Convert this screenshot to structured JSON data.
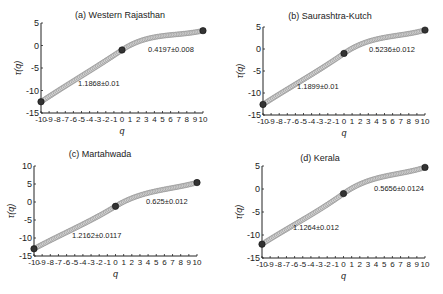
{
  "chart_data": [
    {
      "type": "line",
      "title": "(a) Western Rajasthan",
      "xlabel": "q",
      "ylabel": "τ(q)",
      "xlim": [
        -10,
        10
      ],
      "ylim": [
        -15,
        5
      ],
      "xticks": [
        -10,
        -9,
        -8,
        -7,
        -6,
        -5,
        -4,
        -3,
        -2,
        -1,
        0,
        1,
        2,
        3,
        4,
        5,
        6,
        7,
        8,
        9,
        10
      ],
      "yticks": [
        5,
        0,
        -5,
        -10,
        -15
      ],
      "grid": false,
      "key_points": [
        {
          "q": -10,
          "tau": -12.5
        },
        {
          "q": 0,
          "tau": -1.0
        },
        {
          "q": 10,
          "tau": 3.3
        }
      ],
      "annotations": [
        {
          "text": "1.1868±0.01",
          "segment": "q<0",
          "slope": 1.1868,
          "err": 0.01
        },
        {
          "text": "0.4197±0.008",
          "segment": "q>0",
          "slope": 0.4197,
          "err": 0.008
        }
      ]
    },
    {
      "type": "line",
      "title": "(b) Saurashtra-Kutch",
      "xlabel": "q",
      "ylabel": "τ(q)",
      "xlim": [
        -10,
        10
      ],
      "ylim": [
        -15,
        5
      ],
      "xticks": [
        -10,
        -9,
        -8,
        -7,
        -6,
        -5,
        -4,
        -3,
        -2,
        -1,
        0,
        1,
        2,
        3,
        4,
        5,
        6,
        7,
        8,
        9,
        10
      ],
      "yticks": [
        5,
        0,
        -5,
        -10,
        -15
      ],
      "grid": false,
      "key_points": [
        {
          "q": -10,
          "tau": -12.6
        },
        {
          "q": 0,
          "tau": -1.0
        },
        {
          "q": 10,
          "tau": 4.3
        }
      ],
      "annotations": [
        {
          "text": "1.1899±0.01",
          "segment": "q<0",
          "slope": 1.1899,
          "err": 0.01
        },
        {
          "text": "0.5236±0.012",
          "segment": "q>0",
          "slope": 0.5236,
          "err": 0.012
        }
      ]
    },
    {
      "type": "line",
      "title": "(c) Martahwada",
      "xlabel": "q",
      "ylabel": "τ(q)",
      "xlim": [
        -10,
        10
      ],
      "ylim": [
        -15,
        10
      ],
      "xticks": [
        -10,
        -9,
        -8,
        -7,
        -6,
        -5,
        -4,
        -3,
        -2,
        -1,
        0,
        1,
        2,
        3,
        4,
        5,
        6,
        7,
        8,
        9,
        10
      ],
      "yticks": [
        10,
        5,
        0,
        -5,
        -10,
        -15
      ],
      "grid": false,
      "key_points": [
        {
          "q": -10,
          "tau": -13.0
        },
        {
          "q": 0,
          "tau": -1.2
        },
        {
          "q": 10,
          "tau": 5.4
        }
      ],
      "annotations": [
        {
          "text": "1.2162±0.0117",
          "segment": "q<0",
          "slope": 1.2162,
          "err": 0.0117
        },
        {
          "text": "0.625±0.012",
          "segment": "q>0",
          "slope": 0.625,
          "err": 0.012
        }
      ]
    },
    {
      "type": "line",
      "title": "(d) Kerala",
      "xlabel": "q",
      "ylabel": "τ(q)",
      "xlim": [
        -10,
        10
      ],
      "ylim": [
        -15,
        5
      ],
      "xticks": [
        -10,
        -9,
        -8,
        -7,
        -6,
        -5,
        -4,
        -3,
        -2,
        -1,
        0,
        1,
        2,
        3,
        4,
        5,
        6,
        7,
        8,
        9,
        10
      ],
      "yticks": [
        5,
        0,
        -5,
        -10,
        -15
      ],
      "grid": false,
      "key_points": [
        {
          "q": -10,
          "tau": -12.0
        },
        {
          "q": 0,
          "tau": -1.0
        },
        {
          "q": 10,
          "tau": 4.7
        }
      ],
      "annotations": [
        {
          "text": "1.1264±0.012",
          "segment": "q<0",
          "slope": 1.1264,
          "err": 0.012
        },
        {
          "text": "0.5656±0.0124",
          "segment": "q>0",
          "slope": 0.5656,
          "err": 0.0124
        }
      ]
    }
  ],
  "layout": [
    {
      "left": 0,
      "top": 0,
      "ax_x0": 41,
      "ax_x1": 203,
      "ax_ytop": 23,
      "ax_ybot": 113,
      "title_x": 120,
      "title_y": 18,
      "left_ann": {
        "x": 78,
        "y": 86
      },
      "right_ann": {
        "x": 148,
        "y": 52
      }
    },
    {
      "left": 0,
      "top": 0,
      "ax_x0": 263,
      "ax_x1": 425,
      "ax_ytop": 27,
      "ax_ybot": 115,
      "title_x": 330,
      "title_y": 19,
      "left_ann": {
        "x": 297,
        "y": 89
      },
      "right_ann": {
        "x": 369,
        "y": 52
      }
    },
    {
      "left": 0,
      "top": 0,
      "ax_x0": 34,
      "ax_x1": 197,
      "ax_ytop": 166,
      "ax_ybot": 256,
      "title_x": 100,
      "title_y": 157,
      "left_ann": {
        "x": 72,
        "y": 238
      },
      "right_ann": {
        "x": 146,
        "y": 204
      }
    },
    {
      "left": 0,
      "top": 0,
      "ax_x0": 262,
      "ax_x1": 425,
      "ax_ytop": 166,
      "ax_ybot": 258,
      "title_x": 320,
      "title_y": 161,
      "left_ann": {
        "x": 293,
        "y": 230
      },
      "right_ann": {
        "x": 374,
        "y": 191
      }
    }
  ],
  "colors": {
    "axis": "#222222",
    "marker_stroke": "#8a8a8a",
    "marker_fill": "#d8d8d8",
    "key_marker": "#333333",
    "text": "#222222"
  }
}
